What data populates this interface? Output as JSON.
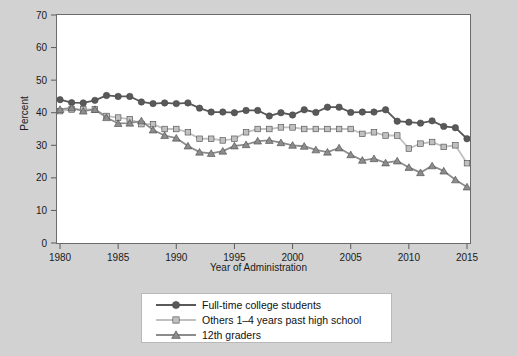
{
  "chart_data": {
    "type": "line",
    "title": "",
    "xlabel": "Year of Administration",
    "ylabel": "Percent",
    "xlim": [
      1980,
      2015
    ],
    "ylim": [
      0,
      70
    ],
    "xticks": [
      1980,
      1985,
      1990,
      1995,
      2000,
      2005,
      2010,
      2015
    ],
    "yticks": [
      0,
      10,
      20,
      30,
      40,
      50,
      60,
      70
    ],
    "grid": false,
    "legend_position": "bottom-center",
    "x": [
      1980,
      1981,
      1982,
      1983,
      1984,
      1985,
      1986,
      1987,
      1988,
      1989,
      1990,
      1991,
      1992,
      1993,
      1994,
      1995,
      1996,
      1997,
      1998,
      1999,
      2000,
      2001,
      2002,
      2003,
      2004,
      2005,
      2006,
      2007,
      2008,
      2009,
      2010,
      2011,
      2012,
      2013,
      2014,
      2015
    ],
    "series": [
      {
        "name": "Full-time college students",
        "marker": "circle",
        "color": "#595959",
        "values": [
          44.0,
          43.1,
          43.0,
          43.8,
          45.3,
          45.0,
          45.0,
          43.3,
          42.8,
          43.0,
          42.8,
          43.0,
          41.4,
          40.2,
          40.2,
          40.0,
          40.7,
          40.7,
          39.0,
          40.0,
          39.3,
          40.9,
          40.1,
          41.7,
          41.7,
          40.1,
          40.2,
          40.2,
          40.9,
          37.4,
          37.1,
          36.8,
          37.5,
          35.8,
          35.4,
          32.0
        ]
      },
      {
        "name": "Others 1–4 years past high school",
        "marker": "square",
        "color": "#c0c0c0",
        "values": [
          40.5,
          41.0,
          41.0,
          41.0,
          39.0,
          38.5,
          38.0,
          36.5,
          36.5,
          35.0,
          35.0,
          34.0,
          32.0,
          32.0,
          31.5,
          32.0,
          34.0,
          35.0,
          35.0,
          35.5,
          35.5,
          35.0,
          35.0,
          35.0,
          35.0,
          35.0,
          33.5,
          34.0,
          33.0,
          33.0,
          29.0,
          30.5,
          31.0,
          29.5,
          30.0,
          24.5
        ]
      },
      {
        "name": "12th graders",
        "marker": "triangle",
        "color": "#8c8c8c",
        "values": [
          41.0,
          41.5,
          40.5,
          41.0,
          38.5,
          36.7,
          36.8,
          37.5,
          34.7,
          33.0,
          32.2,
          29.8,
          27.9,
          27.5,
          28.2,
          29.8,
          30.2,
          31.3,
          31.5,
          30.8,
          30.0,
          29.7,
          28.6,
          27.9,
          29.2,
          27.1,
          25.4,
          25.9,
          24.6,
          25.2,
          23.2,
          21.6,
          23.7,
          22.1,
          19.4,
          17.2
        ]
      }
    ]
  },
  "legend": {
    "items": [
      {
        "label": "Full-time college students",
        "marker": "circle-marker"
      },
      {
        "label": "Others 1–4 years past high school",
        "marker": "square-marker"
      },
      {
        "label": "12th graders",
        "marker": "triangle-marker"
      }
    ]
  },
  "axes": {
    "x_title": "Year of Administration",
    "y_title": "Percent",
    "x_tick_labels": [
      "1980",
      "1985",
      "1990",
      "1995",
      "2000",
      "2005",
      "2010",
      "2015"
    ],
    "y_tick_labels": [
      "0",
      "10",
      "20",
      "30",
      "40",
      "50",
      "60",
      "70"
    ]
  },
  "colors": {
    "background": "#d2d2d2",
    "plot_background": "#ffffff",
    "series_1": "#595959",
    "series_2": "#c0c0c0",
    "series_3": "#8c8c8c",
    "axis": "#5a5a5a"
  }
}
